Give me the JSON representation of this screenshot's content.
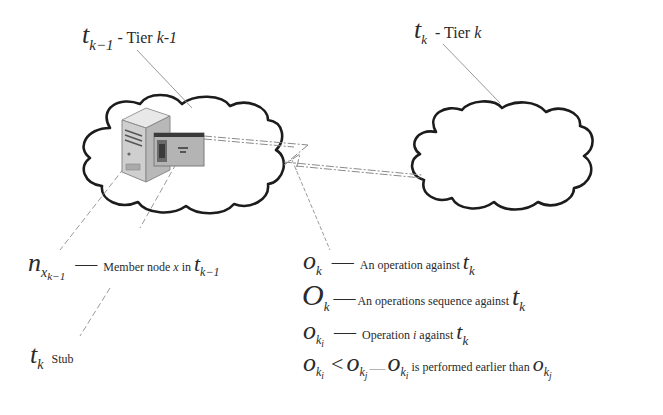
{
  "diagram": {
    "tier_prev": {
      "symbol": "t",
      "subscript": "k−1",
      "label": " - Tier ",
      "label_var": "k-1"
    },
    "tier_curr": {
      "symbol": "t",
      "subscript": "k",
      "label": "  - Tier ",
      "label_var": "k"
    },
    "member_node": {
      "symbol": "n",
      "subscript": "x",
      "subsubscript": "k−1",
      "dash": "—",
      "desc": "Member node ",
      "desc_var": "x",
      "desc_in": " in ",
      "ref_symbol": "t",
      "ref_subscript": "k−1"
    },
    "stub": {
      "symbol": "t",
      "subscript": "k",
      "desc": "Stub"
    },
    "legend": [
      {
        "symbol": "o",
        "subscript": "k",
        "dash": "—",
        "desc": "An operation against ",
        "ref_symbol": "t",
        "ref_subscript": "k"
      },
      {
        "symbol": "O",
        "subscript": "k",
        "dash": "—",
        "desc": "An operations sequence against ",
        "ref_symbol": "t",
        "ref_subscript": "k"
      },
      {
        "symbol": "o",
        "subscript": "k",
        "subsubscript": "i",
        "dash": "—",
        "desc": "Operation ",
        "desc_var": "i",
        "desc_after": " against ",
        "ref_symbol": "t",
        "ref_subscript": "k"
      },
      {
        "lhs_symbol": "o",
        "lhs_sub": "k",
        "lhs_subsub": "i",
        "op": "<",
        "rhs_symbol": "o",
        "rhs_sub": "k",
        "rhs_subsub": "j",
        "sep": "——",
        "a_symbol": "o",
        "a_sub": "k",
        "a_subsub": "i",
        "desc": " is performed earlier than ",
        "b_symbol": "o",
        "b_sub": "k",
        "b_subsub": "j"
      }
    ],
    "icons": {
      "left_cloud": "cloud-icon",
      "right_cloud": "cloud-icon",
      "server": "server-icon",
      "stub": "stub-window-icon"
    }
  }
}
